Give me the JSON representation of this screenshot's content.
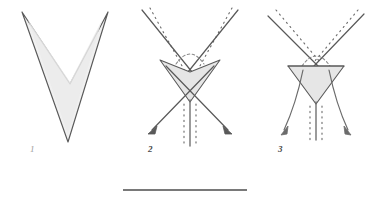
{
  "figure": {
    "background_color": "#ffffff",
    "width": 375,
    "height": 204,
    "stroke_color": "#595959",
    "stroke_color_light": "#8a8a8a",
    "fill_color": "#ececec",
    "fill_color_light": "#f2f2f2",
    "dot_color": "#6e6e6e",
    "scalebar_color": "#4d4d4d"
  },
  "panels": [
    {
      "id": "panel-1",
      "label": "1",
      "label_x": 30,
      "label_y": 152,
      "label_style": "faint",
      "description": "Solid shaded chevron (arrowhead) outline, no dotted lines, no arrows",
      "shape_points": "22,12 70,84 108,12 68,142",
      "has_dotted_lines": false,
      "has_arrows": false,
      "has_axis": false
    },
    {
      "id": "panel-2",
      "label": "2",
      "label_x": 148,
      "label_y": 152,
      "label_style": "bold",
      "description": "Narrow V with dotted parallels, small shaded inner chevron, dashed arc cap, two divergent arrows and dotted vertical axis",
      "v_left_top_x": 142,
      "v_left_top_y": 10,
      "v_right_top_x": 238,
      "v_right_top_y": 10,
      "v_apex_x": 190,
      "v_apex_y": 94,
      "shape_points": "160,60 190,72 220,60 190,100",
      "has_dotted_lines": true,
      "has_arrows": true,
      "has_axis": true,
      "arc_cap": true
    },
    {
      "id": "panel-3",
      "label": "3",
      "label_x": 278,
      "label_y": 152,
      "label_style": "bold",
      "description": "Wide shallow V with dotted parallels, shaded inverted triangle, dashed arc cap, two divergent arrows and dotted vertical axis",
      "v_left_top_x": 270,
      "v_left_top_y": 14,
      "v_right_top_x": 362,
      "v_right_top_y": 14,
      "v_apex_x": 316,
      "v_apex_y": 70,
      "shape_points": "288,66 344,66 316,104",
      "has_dotted_lines": true,
      "has_arrows": true,
      "has_axis": true,
      "arc_cap": true
    }
  ],
  "scalebar": {
    "name": "scale-bar",
    "x1": 123,
    "x2": 247,
    "y": 190,
    "thickness": 1.6,
    "label": ""
  },
  "legend": {
    "solid_line": "solid line",
    "dotted_line": "dotted line",
    "arrow": "arrow",
    "shaded_region": "shaded region"
  }
}
